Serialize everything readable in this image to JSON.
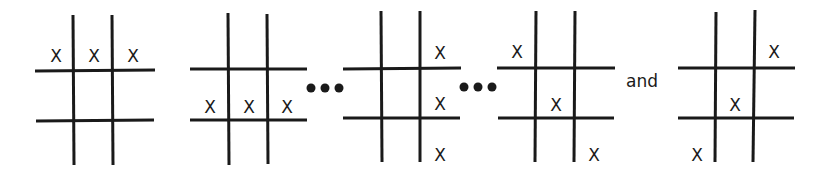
{
  "mark_symbol": "X",
  "ellipsis": "•••",
  "conjunction": "and",
  "colors": {
    "ink": "#1a1a1a",
    "background": "#ffffff"
  },
  "boards": [
    {
      "id": "row-top",
      "label": "Top row",
      "cells": [
        [
          0,
          0
        ],
        [
          0,
          1
        ],
        [
          0,
          2
        ]
      ]
    },
    {
      "id": "row-middle",
      "label": "Middle row",
      "cells": [
        [
          1,
          0
        ],
        [
          1,
          1
        ],
        [
          1,
          2
        ]
      ]
    },
    {
      "id": "col-right",
      "label": "Right column",
      "cells": [
        [
          0,
          2
        ],
        [
          1,
          2
        ],
        [
          2,
          2
        ]
      ]
    },
    {
      "id": "diag-main",
      "label": "Main diagonal",
      "cells": [
        [
          0,
          0
        ],
        [
          1,
          1
        ],
        [
          2,
          2
        ]
      ]
    },
    {
      "id": "diag-anti",
      "label": "Anti diagonal",
      "cells": [
        [
          0,
          2
        ],
        [
          1,
          1
        ],
        [
          2,
          0
        ]
      ]
    }
  ],
  "separators": [
    "•••",
    "•••",
    "and"
  ]
}
